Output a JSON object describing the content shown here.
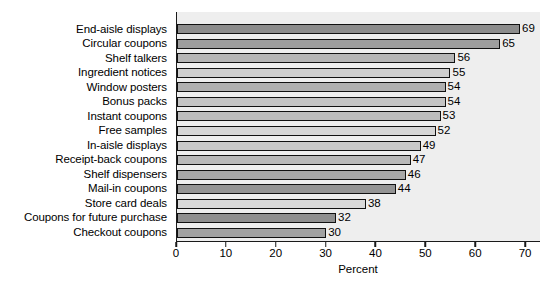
{
  "chart_data": {
    "type": "bar",
    "orientation": "horizontal",
    "title": "",
    "xlabel": "Percent",
    "ylabel": "",
    "xlim": [
      0,
      73
    ],
    "xticks": [
      0,
      10,
      20,
      30,
      40,
      50,
      60,
      70
    ],
    "grid": false,
    "legend": null,
    "categories": [
      "End-aisle displays",
      "Circular coupons",
      "Shelf talkers",
      "Ingredient notices",
      "Window posters",
      "Bonus packs",
      "Instant coupons",
      "Free samples",
      "In-aisle displays",
      "Receipt-back coupons",
      "Shelf dispensers",
      "Mail-in coupons",
      "Store card deals",
      "Coupons for future purchase",
      "Checkout coupons"
    ],
    "values": [
      69,
      65,
      56,
      55,
      54,
      54,
      53,
      52,
      49,
      47,
      46,
      44,
      38,
      32,
      30
    ],
    "value_labels": [
      "69",
      "65",
      "56",
      "55",
      "54",
      "54",
      "53",
      "52",
      "49",
      "47",
      "46",
      "44",
      "38",
      "32",
      "30"
    ],
    "bar_colors": [
      "#8c8c8c",
      "#9e9e9e",
      "#b5b5b5",
      "#cfcfcf",
      "#b0b0b0",
      "#c4c4c4",
      "#bdbdbd",
      "#d6d6d6",
      "#c9c9c9",
      "#b8b8b8",
      "#a8a8a8",
      "#949494",
      "#d9d9d9",
      "#8f8f8f",
      "#a2a2a2"
    ],
    "plot_background": "#eeeeee",
    "axis_color": "#1a1a1a",
    "bar_border_color": "#111111"
  }
}
